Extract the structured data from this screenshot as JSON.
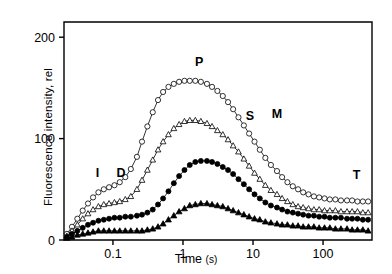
{
  "chart_data": {
    "type": "line",
    "title": "",
    "xlabel": "Time",
    "xunit": "(s)",
    "ylabel": "Fluorescence intensity, rel",
    "xscale": "log",
    "xlim": [
      0.02,
      500
    ],
    "ylim": [
      0,
      215
    ],
    "yticks": [
      0,
      100,
      200
    ],
    "ytick_labels": [
      "0",
      "100",
      "200"
    ],
    "xticks": [
      0.1,
      1,
      10,
      100
    ],
    "xtick_labels": [
      "0.1",
      "1",
      "10",
      "100"
    ],
    "grid": false,
    "legend": "none",
    "annotations": [
      {
        "label": "I",
        "x": 0.06,
        "y": 62
      },
      {
        "label": "D",
        "x": 0.13,
        "y": 62
      },
      {
        "label": "P",
        "x": 1.7,
        "y": 172
      },
      {
        "label": "S",
        "x": 9.0,
        "y": 118
      },
      {
        "label": "M",
        "x": 22.0,
        "y": 120
      },
      {
        "label": "T",
        "x": 300.0,
        "y": 60
      }
    ],
    "series": [
      {
        "name": "curve-p-open-circle",
        "marker": "open-circle",
        "x": [
          0.022,
          0.026,
          0.031,
          0.037,
          0.044,
          0.052,
          0.062,
          0.074,
          0.088,
          0.105,
          0.125,
          0.15,
          0.18,
          0.22,
          0.26,
          0.31,
          0.37,
          0.44,
          0.52,
          0.62,
          0.74,
          0.88,
          1.05,
          1.25,
          1.5,
          1.8,
          2.2,
          2.6,
          3.1,
          3.7,
          4.4,
          5.2,
          6.2,
          7.4,
          8.8,
          10.5,
          12.5,
          15,
          18,
          22,
          26,
          31,
          37,
          44,
          52,
          62,
          74,
          88,
          105,
          125,
          150,
          180,
          220,
          260,
          310,
          370,
          440
        ],
        "y": [
          6,
          13,
          21,
          29,
          36,
          42,
          47,
          50,
          52,
          54,
          57,
          62,
          70,
          82,
          97,
          112,
          126,
          138,
          146,
          151,
          154,
          156,
          157,
          157,
          157,
          156,
          154,
          151,
          147,
          142,
          136,
          129,
          121,
          113,
          105,
          97,
          89,
          81,
          74,
          68,
          62,
          57,
          53,
          50,
          47,
          45,
          43,
          42,
          41,
          40,
          40,
          39,
          39,
          39,
          38,
          38,
          38
        ]
      },
      {
        "name": "curve-open-triangle",
        "marker": "open-triangle",
        "x": [
          0.022,
          0.026,
          0.031,
          0.037,
          0.044,
          0.052,
          0.062,
          0.074,
          0.088,
          0.105,
          0.125,
          0.15,
          0.18,
          0.22,
          0.26,
          0.31,
          0.37,
          0.44,
          0.52,
          0.62,
          0.74,
          0.88,
          1.05,
          1.25,
          1.5,
          1.8,
          2.2,
          2.6,
          3.1,
          3.7,
          4.4,
          5.2,
          6.2,
          7.4,
          8.8,
          10.5,
          12.5,
          15,
          18,
          22,
          26,
          31,
          37,
          44,
          52,
          62,
          74,
          88,
          105,
          125,
          150,
          180,
          220,
          260,
          310,
          370,
          440
        ],
        "y": [
          4,
          9,
          15,
          21,
          26,
          30,
          33,
          35,
          36,
          37,
          38,
          40,
          43,
          50,
          59,
          69,
          79,
          89,
          97,
          104,
          110,
          114,
          117,
          118,
          118,
          117,
          115,
          112,
          108,
          104,
          99,
          93,
          87,
          80,
          73,
          66,
          60,
          54,
          49,
          45,
          41,
          38,
          35,
          33,
          32,
          31,
          30,
          30,
          29,
          29,
          29,
          28,
          28,
          28,
          28,
          27,
          27
        ]
      },
      {
        "name": "curve-filled-circle",
        "marker": "filled-circle",
        "x": [
          0.022,
          0.026,
          0.031,
          0.037,
          0.044,
          0.052,
          0.062,
          0.074,
          0.088,
          0.105,
          0.125,
          0.15,
          0.18,
          0.22,
          0.26,
          0.31,
          0.37,
          0.44,
          0.52,
          0.62,
          0.74,
          0.88,
          1.05,
          1.25,
          1.5,
          1.8,
          2.2,
          2.6,
          3.1,
          3.7,
          4.4,
          5.2,
          6.2,
          7.4,
          8.8,
          10.5,
          12.5,
          15,
          18,
          22,
          26,
          31,
          37,
          44,
          52,
          62,
          74,
          88,
          105,
          125,
          150,
          180,
          220,
          260,
          310,
          370,
          440
        ],
        "y": [
          3,
          6,
          9,
          12,
          15,
          17,
          19,
          20,
          21,
          22,
          22,
          23,
          23,
          24,
          25,
          27,
          30,
          35,
          41,
          48,
          56,
          63,
          69,
          74,
          77,
          78,
          78,
          77,
          75,
          72,
          69,
          65,
          60,
          55,
          50,
          45,
          41,
          37,
          34,
          32,
          30,
          28,
          27,
          26,
          25,
          24,
          24,
          23,
          23,
          22,
          22,
          22,
          21,
          21,
          21,
          20,
          20
        ]
      },
      {
        "name": "curve-filled-triangle",
        "marker": "filled-triangle",
        "x": [
          0.022,
          0.026,
          0.031,
          0.037,
          0.044,
          0.052,
          0.062,
          0.074,
          0.088,
          0.105,
          0.125,
          0.15,
          0.18,
          0.22,
          0.26,
          0.31,
          0.37,
          0.44,
          0.52,
          0.62,
          0.74,
          0.88,
          1.05,
          1.25,
          1.5,
          1.8,
          2.2,
          2.6,
          3.1,
          3.7,
          4.4,
          5.2,
          6.2,
          7.4,
          8.8,
          10.5,
          12.5,
          15,
          18,
          22,
          26,
          31,
          37,
          44,
          52,
          62,
          74,
          88,
          105,
          125,
          150,
          180,
          220,
          260,
          310,
          370,
          440
        ],
        "y": [
          2,
          3,
          5,
          6,
          7,
          8,
          9,
          9,
          9,
          9,
          9,
          9,
          9,
          9,
          9,
          10,
          11,
          13,
          16,
          20,
          24,
          28,
          31,
          34,
          35,
          36,
          36,
          35,
          34,
          33,
          31,
          29,
          27,
          25,
          23,
          21,
          20,
          18,
          17,
          16,
          15,
          15,
          14,
          14,
          13,
          13,
          13,
          12,
          12,
          12,
          11,
          11,
          11,
          10,
          10,
          10,
          9
        ]
      }
    ]
  }
}
